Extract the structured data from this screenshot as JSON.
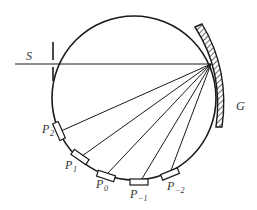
{
  "diagram": {
    "type": "rowland-circle-spectrometer",
    "labels": {
      "source": "S",
      "grating": "G",
      "detectors": [
        {
          "base": "P",
          "sub": "2"
        },
        {
          "base": "P",
          "sub": "1"
        },
        {
          "base": "P",
          "sub": "0"
        },
        {
          "base": "P",
          "sub": "−1"
        },
        {
          "base": "P",
          "sub": "−2"
        }
      ]
    },
    "colors": {
      "stroke": "#1a1a1a",
      "text": "#333333",
      "background": "#ffffff"
    }
  }
}
